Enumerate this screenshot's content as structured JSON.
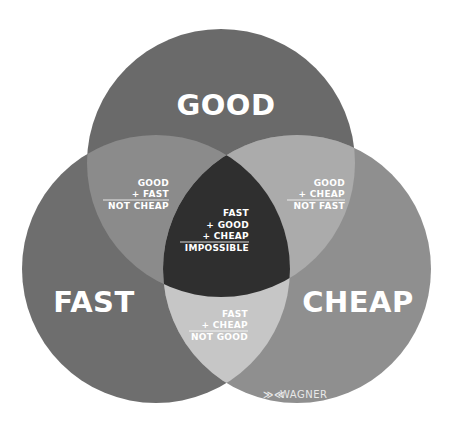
{
  "diagram": {
    "type": "venn",
    "sets": [
      {
        "id": "good",
        "label": "GOOD",
        "color": "#6a6a6a"
      },
      {
        "id": "fast",
        "label": "FAST",
        "color": "#6e6e6e"
      },
      {
        "id": "cheap",
        "label": "CHEAP",
        "color": "#8f8f8f"
      }
    ],
    "intersections": {
      "good_fast": {
        "color": "#8b8b8b",
        "line1": "GOOD",
        "line2": "+ FAST",
        "result": "NOT CHEAP"
      },
      "good_cheap": {
        "color": "#ababab",
        "line1": "GOOD",
        "line2": "+ CHEAP",
        "result": "NOT FAST"
      },
      "fast_cheap": {
        "color": "#c6c6c6",
        "line1": "FAST",
        "line2": "+ CHEAP",
        "result": "NOT GOOD"
      },
      "all": {
        "color": "#2f2f2f",
        "line1": "FAST",
        "line2": "+ GOOD",
        "line3": "+ CHEAP",
        "result": "IMPOSSIBLE"
      }
    },
    "logo": {
      "mark": "≫≪",
      "text": "WAGNER"
    }
  }
}
